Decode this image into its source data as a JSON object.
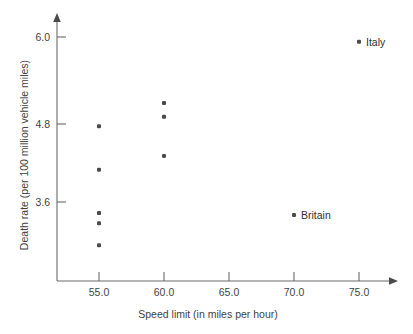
{
  "chart_data": {
    "type": "scatter",
    "title": "",
    "xlabel": "Speed limit (in miles per hour)",
    "ylabel": "Death rate (per 100 million vehicle miles)",
    "xlim": [
      52.0,
      78.0
    ],
    "ylim": [
      2.5,
      6.3
    ],
    "grid": false,
    "legend": "none",
    "xticks": [
      "55.0",
      "60.0",
      "65.0",
      "70.0",
      "75.0"
    ],
    "xtick_values": [
      55.0,
      60.0,
      65.0,
      70.0,
      75.0
    ],
    "yticks": [
      "6.0",
      "4.8",
      "3.6"
    ],
    "ytick_values": [
      6.0,
      4.8,
      3.6
    ],
    "points": [
      {
        "x": 55.0,
        "y": 4.7,
        "label": ""
      },
      {
        "x": 55.0,
        "y": 4.07,
        "label": ""
      },
      {
        "x": 55.0,
        "y": 3.44,
        "label": ""
      },
      {
        "x": 55.0,
        "y": 3.29,
        "label": ""
      },
      {
        "x": 55.0,
        "y": 2.97,
        "label": ""
      },
      {
        "x": 60.0,
        "y": 5.04,
        "label": ""
      },
      {
        "x": 60.0,
        "y": 4.84,
        "label": ""
      },
      {
        "x": 60.0,
        "y": 4.27,
        "label": ""
      },
      {
        "x": 70.0,
        "y": 3.41,
        "label": "Britain"
      },
      {
        "x": 75.0,
        "y": 5.93,
        "label": "Italy"
      }
    ],
    "annotations": [
      {
        "text": "Italy",
        "x": 75.0,
        "y": 5.93
      },
      {
        "text": "Britain",
        "x": 70.0,
        "y": 3.41
      }
    ],
    "colors": {
      "marker": "#4b4b4b",
      "axis": "#6b6b6b",
      "text": "#3f3f3f",
      "background": "#ffffff"
    }
  },
  "axes": {
    "x_title": "Speed limit (in miles per hour)",
    "y_title": "Death rate (per 100 million vehicle miles)",
    "x_tick_labels": [
      "55.0",
      "60.0",
      "65.0",
      "70.0",
      "75.0"
    ],
    "y_tick_labels": [
      "6.0",
      "4.8",
      "3.6"
    ]
  },
  "labels": {
    "italy": "Italy",
    "britain": "Britain"
  }
}
